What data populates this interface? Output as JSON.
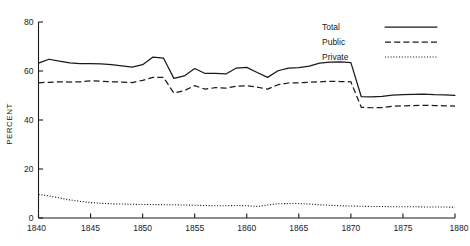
{
  "chart_data": {
    "type": "line",
    "title": "",
    "xlabel": "",
    "ylabel": "PERCENT",
    "xlim": [
      1840,
      1880
    ],
    "ylim": [
      0,
      80
    ],
    "xticks": [
      1840,
      1845,
      1850,
      1855,
      1860,
      1865,
      1870,
      1875,
      1880
    ],
    "yticks": [
      0,
      20,
      40,
      60,
      80
    ],
    "xticklabels": [
      "1840",
      "1845",
      "1850",
      "1855",
      "1860",
      "1865",
      "1870",
      "1875",
      "1880"
    ],
    "yticklabels": [
      "0",
      "20",
      "40",
      "60",
      "80"
    ],
    "grid": false,
    "legend_position": "top-right",
    "x": [
      1840,
      1841,
      1842,
      1843,
      1844,
      1845,
      1846,
      1847,
      1848,
      1849,
      1850,
      1851,
      1852,
      1853,
      1854,
      1855,
      1856,
      1857,
      1858,
      1859,
      1860,
      1861,
      1862,
      1863,
      1864,
      1865,
      1866,
      1867,
      1868,
      1869,
      1870,
      1871,
      1872,
      1873,
      1874,
      1875,
      1876,
      1877,
      1878,
      1879,
      1880
    ],
    "series": [
      {
        "name": "Total",
        "style": "solid",
        "values": [
          63.2,
          64.8,
          64.0,
          63.3,
          63.0,
          63.0,
          62.9,
          62.6,
          62.1,
          61.6,
          62.6,
          65.7,
          65.3,
          57.0,
          58.0,
          61.0,
          59.0,
          59.0,
          58.8,
          61.2,
          61.5,
          59.4,
          57.4,
          60.1,
          61.2,
          61.4,
          62.0,
          63.2,
          63.6,
          63.7,
          63.4,
          49.5,
          49.4,
          49.6,
          50.2,
          50.4,
          50.5,
          50.6,
          50.4,
          50.3,
          50.1
        ]
      },
      {
        "name": "Public",
        "style": "dashed",
        "values": [
          55.2,
          55.4,
          55.6,
          55.5,
          55.6,
          56.0,
          55.8,
          55.6,
          55.5,
          55.3,
          56.2,
          57.4,
          57.4,
          51.0,
          52.0,
          54.0,
          52.6,
          53.2,
          53.0,
          53.8,
          54.0,
          53.4,
          52.6,
          54.4,
          55.1,
          55.2,
          55.4,
          55.6,
          55.8,
          55.7,
          55.6,
          45.2,
          45.0,
          45.1,
          45.6,
          45.8,
          45.9,
          46.0,
          45.9,
          45.8,
          45.7
        ]
      },
      {
        "name": "Private",
        "style": "dotted",
        "values": [
          9.6,
          9.0,
          8.2,
          7.4,
          6.8,
          6.3,
          6.0,
          5.8,
          5.7,
          5.6,
          5.5,
          5.5,
          5.4,
          5.4,
          5.3,
          5.2,
          5.1,
          5.0,
          5.0,
          5.1,
          5.0,
          4.7,
          5.3,
          5.8,
          5.9,
          5.9,
          5.7,
          5.4,
          5.2,
          5.0,
          4.9,
          4.8,
          4.7,
          4.7,
          4.6,
          4.6,
          4.6,
          4.5,
          4.5,
          4.5,
          4.4
        ]
      }
    ],
    "legend": [
      {
        "label": "Total",
        "style": "solid"
      },
      {
        "label": "Public",
        "style": "dashed"
      },
      {
        "label": "Private",
        "style": "dotted"
      }
    ]
  }
}
